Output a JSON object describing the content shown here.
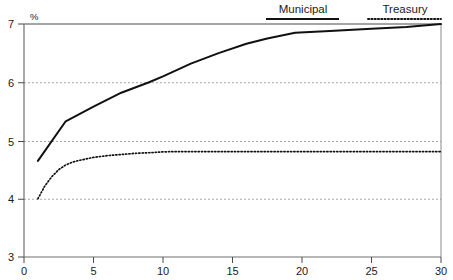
{
  "chart_data": {
    "type": "line",
    "title": "",
    "subtitle": "",
    "xlabel": "",
    "ylabel": "%",
    "ylim": [
      3,
      7
    ],
    "xlim": [
      0,
      30
    ],
    "yticks": [
      3,
      4,
      5,
      6,
      7
    ],
    "xticks": [
      0,
      5,
      10,
      15,
      20,
      25,
      30
    ],
    "ytick_labels": [
      "3",
      "4",
      "5",
      "6",
      "7"
    ],
    "xtick_labels": [
      "0",
      "5",
      "10",
      "15",
      "20",
      "25",
      "30"
    ],
    "grid": "horizontal-dashed",
    "legend_position": "top-right",
    "series": [
      {
        "name": "Municipal",
        "style": "solid",
        "color": "#111111",
        "x": [
          1.0,
          3.0,
          5.0,
          7.0,
          9.0,
          10.0,
          12.0,
          14.0,
          16.0,
          17.5,
          19.5,
          22.0,
          25.0,
          27.5,
          30.0
        ],
        "values": [
          4.65,
          5.33,
          5.58,
          5.82,
          6.0,
          6.1,
          6.32,
          6.5,
          6.66,
          6.75,
          6.85,
          6.88,
          6.92,
          6.95,
          7.0
        ]
      },
      {
        "name": "Treasury",
        "style": "dotted",
        "color": "#111111",
        "x": [
          1.0,
          1.5,
          2.0,
          2.5,
          3.0,
          3.5,
          4.0,
          5.0,
          6.0,
          7.0,
          8.0,
          9.0,
          10.0,
          11.0,
          13.0,
          16.0,
          20.0,
          25.0,
          30.0
        ],
        "values": [
          4.0,
          4.22,
          4.38,
          4.5,
          4.58,
          4.63,
          4.66,
          4.71,
          4.74,
          4.76,
          4.78,
          4.79,
          4.805,
          4.81,
          4.81,
          4.81,
          4.81,
          4.81,
          4.81
        ]
      }
    ]
  },
  "legend": {
    "items": [
      {
        "label": "Municipal",
        "style": "solid"
      },
      {
        "label": "Treasury",
        "style": "dotted"
      }
    ]
  },
  "axes": {
    "y_unit": "%"
  },
  "colors": {
    "line": "#111111",
    "grid": "#a9a9a9",
    "axis": "#555555",
    "text": "#1a1a1a",
    "background": "#ffffff"
  }
}
